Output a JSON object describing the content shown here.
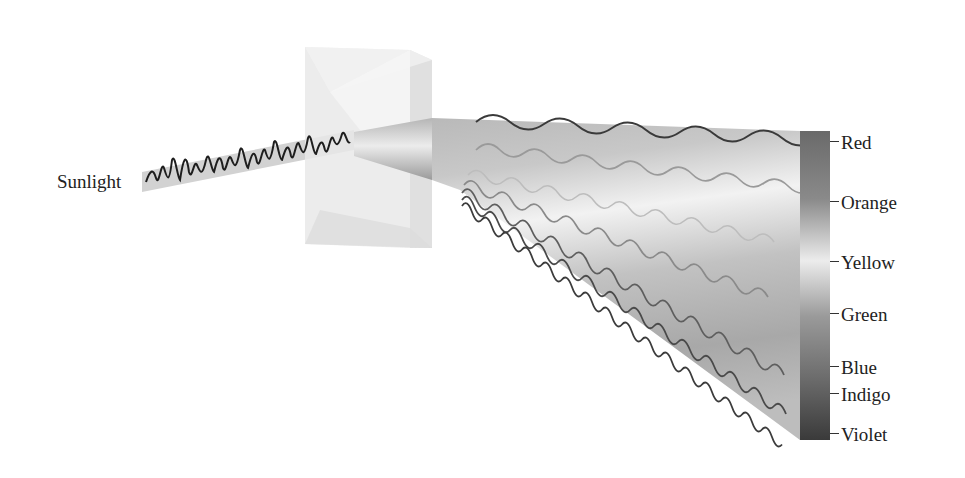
{
  "diagram": {
    "input_label": "Sunlight",
    "spectrum_labels": [
      {
        "label": "Red",
        "y": 141
      },
      {
        "label": "Orange",
        "y": 201
      },
      {
        "label": "Yellow",
        "y": 261
      },
      {
        "label": "Green",
        "y": 313
      },
      {
        "label": "Blue",
        "y": 366
      },
      {
        "label": "Indigo",
        "y": 393
      },
      {
        "label": "Violet",
        "y": 433
      }
    ],
    "colors": {
      "bar_top": "#6e6e6e",
      "bar_mid": "#e6e6e6",
      "bar_bottom": "#3e3e3e",
      "wave_dark": "#3a3a3a",
      "wave_light": "#9a9a9a",
      "beam": "#c8c8c8",
      "prism": "#e4e4e4"
    }
  }
}
